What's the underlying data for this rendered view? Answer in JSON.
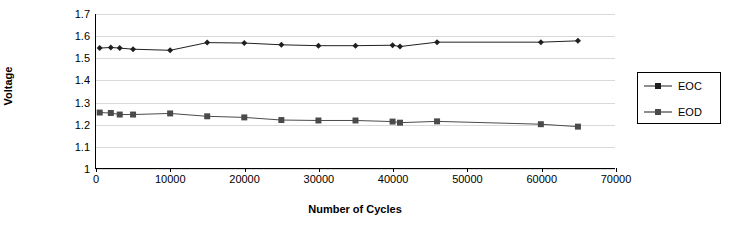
{
  "chart_data": {
    "type": "line",
    "title": "",
    "xlabel": "Number of Cycles",
    "ylabel": "Voltage",
    "xlim": [
      0,
      70000
    ],
    "ylim": [
      1,
      1.7
    ],
    "grid": true,
    "legend_position": "right",
    "xticks": [
      "0",
      "10000",
      "20000",
      "30000",
      "40000",
      "50000",
      "60000",
      "70000"
    ],
    "yticks": [
      "1",
      "1.1",
      "1.2",
      "1.3",
      "1.4",
      "1.5",
      "1.6",
      "1.7"
    ],
    "series": [
      {
        "name": "EOC",
        "marker": "diamond",
        "color": "#1f1f1f",
        "points": [
          {
            "x": 500,
            "y": 1.545
          },
          {
            "x": 2000,
            "y": 1.548
          },
          {
            "x": 3200,
            "y": 1.545
          },
          {
            "x": 5000,
            "y": 1.54
          },
          {
            "x": 10000,
            "y": 1.535
          },
          {
            "x": 15000,
            "y": 1.57
          },
          {
            "x": 20000,
            "y": 1.568
          },
          {
            "x": 25000,
            "y": 1.56
          },
          {
            "x": 30000,
            "y": 1.556
          },
          {
            "x": 35000,
            "y": 1.556
          },
          {
            "x": 40000,
            "y": 1.558
          },
          {
            "x": 41000,
            "y": 1.552
          },
          {
            "x": 46000,
            "y": 1.572
          },
          {
            "x": 60000,
            "y": 1.572
          },
          {
            "x": 65000,
            "y": 1.578
          }
        ]
      },
      {
        "name": "EOD",
        "marker": "square",
        "color": "#4a4a4a",
        "points": [
          {
            "x": 500,
            "y": 1.252
          },
          {
            "x": 2000,
            "y": 1.25
          },
          {
            "x": 3200,
            "y": 1.243
          },
          {
            "x": 5000,
            "y": 1.243
          },
          {
            "x": 10000,
            "y": 1.248
          },
          {
            "x": 15000,
            "y": 1.235
          },
          {
            "x": 20000,
            "y": 1.23
          },
          {
            "x": 25000,
            "y": 1.218
          },
          {
            "x": 30000,
            "y": 1.216
          },
          {
            "x": 35000,
            "y": 1.216
          },
          {
            "x": 40000,
            "y": 1.211
          },
          {
            "x": 41000,
            "y": 1.206
          },
          {
            "x": 46000,
            "y": 1.212
          },
          {
            "x": 60000,
            "y": 1.199
          },
          {
            "x": 65000,
            "y": 1.188
          }
        ]
      }
    ]
  },
  "legend": {
    "items": [
      {
        "label": "EOC"
      },
      {
        "label": "EOD"
      }
    ]
  }
}
